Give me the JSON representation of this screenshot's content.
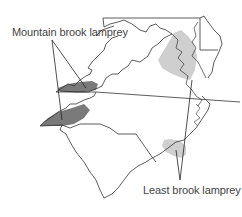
{
  "labels": {
    "mountain": "Mountain brook lamprey",
    "least": "Least brook lamprey"
  },
  "colors": {
    "mountain_range": "#7a7a7a",
    "least_range": "#cfcfcf",
    "outline": "#333333"
  },
  "regions": [
    "Maryland",
    "Delaware",
    "Virginia",
    "North Carolina",
    "South Carolina"
  ]
}
